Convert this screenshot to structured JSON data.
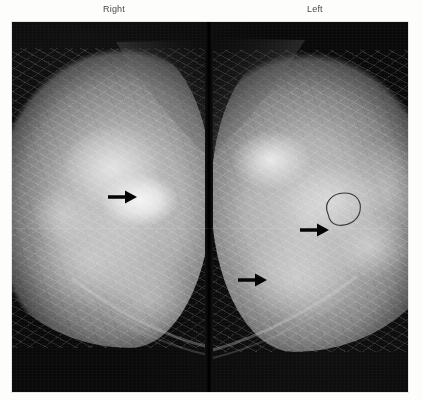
{
  "figure": {
    "modality": "mammogram",
    "view": "craniocaudal bilateral comparison",
    "labels": {
      "right": "Right",
      "left": "Left"
    },
    "panels": [
      {
        "id": "right-breast",
        "side_label": "Right",
        "orientation": "nipple-points-left",
        "annotations": [
          {
            "type": "arrow",
            "name": "right-breast-arrow",
            "direction": "right",
            "points_to": "dense bright mass",
            "x": 110,
            "y": 175
          }
        ]
      },
      {
        "id": "left-breast",
        "side_label": "Left",
        "orientation": "nipple-points-right",
        "annotations": [
          {
            "type": "arrow",
            "name": "left-breast-upper-arrow",
            "direction": "right",
            "points_to": "circumscribed oval lesion",
            "x": 300,
            "y": 208
          },
          {
            "type": "outline",
            "name": "lesion-outline",
            "shape": "oval",
            "x": 318,
            "y": 192,
            "width": 34,
            "height": 30
          },
          {
            "type": "arrow",
            "name": "left-breast-lower-arrow",
            "direction": "right",
            "points_to": "asymmetric density",
            "x": 238,
            "y": 258
          },
          {
            "type": "landmark",
            "name": "nipple-in-profile",
            "x": 372,
            "y": 200
          }
        ]
      }
    ],
    "colors": {
      "film_background": "#090909",
      "page_background": "#fdfdfc",
      "label_text": "#4b4b4b",
      "annotation": "#000000",
      "tissue_bright": "#f2f2f2",
      "tissue_mid": "#b0b0b0"
    }
  }
}
